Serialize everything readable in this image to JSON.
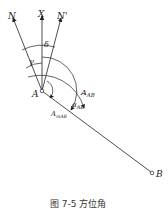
{
  "diagram": {
    "labels": {
      "N": "N",
      "X": "X",
      "N_prime": "N'",
      "delta": "δ",
      "gamma": "γ",
      "A_AB": "A",
      "A_AB_sub": "AB",
      "alpha_AB": "α",
      "alpha_AB_sub": "AB",
      "A_mAB": "A",
      "A_mAB_sub": "mAB",
      "point_A": "A",
      "point_B": "B"
    },
    "caption": "图 7-5  方位角"
  }
}
